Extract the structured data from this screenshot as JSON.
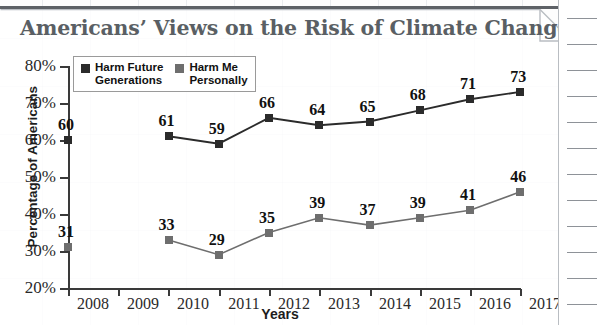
{
  "title": "Americans’ Views on the Risk of Climate Change",
  "axis": {
    "ylabel": "Percentage of Americans",
    "xlabel": "Years"
  },
  "legend": {
    "items": [
      {
        "label": "Harm Future\nGenerations",
        "color": "#2b2b2b",
        "swatch": "legend-swatch-dark"
      },
      {
        "label": "Harm Me\nPersonally",
        "color": "#6e6e6e",
        "swatch": "legend-swatch-gray"
      }
    ]
  },
  "source": "Source: Yale Program on Climate Change Communication and George Mason University Center for Climate Change Communication",
  "chart_data": {
    "type": "line",
    "title": "Americans’ Views on the Risk of Climate Change",
    "xlabel": "Years",
    "ylabel": "Percentage of Americans",
    "categories": [
      "2008",
      "2009",
      "2010",
      "2011",
      "2012",
      "2013",
      "2014",
      "2015",
      "2016",
      "2017"
    ],
    "ytick_labels": [
      "80%",
      "70%",
      "60%",
      "50%",
      "40%",
      "30%",
      "20%"
    ],
    "yticks": [
      80,
      70,
      60,
      50,
      40,
      30,
      20
    ],
    "ylim": [
      20,
      80
    ],
    "grid": false,
    "legend_position": "top-left",
    "series": [
      {
        "name": "Harm Future Generations",
        "color": "#2b2b2b",
        "values": [
          60,
          null,
          61,
          59,
          66,
          64,
          65,
          68,
          71,
          73
        ],
        "labels": [
          "60",
          "",
          "61",
          "59",
          "66",
          "64",
          "65",
          "68",
          "71",
          "73"
        ]
      },
      {
        "name": "Harm Me Personally",
        "color": "#6e6e6e",
        "values": [
          31,
          null,
          33,
          29,
          35,
          39,
          37,
          39,
          41,
          46
        ],
        "labels": [
          "31",
          "",
          "33",
          "29",
          "35",
          "39",
          "37",
          "39",
          "41",
          "46"
        ]
      }
    ]
  }
}
